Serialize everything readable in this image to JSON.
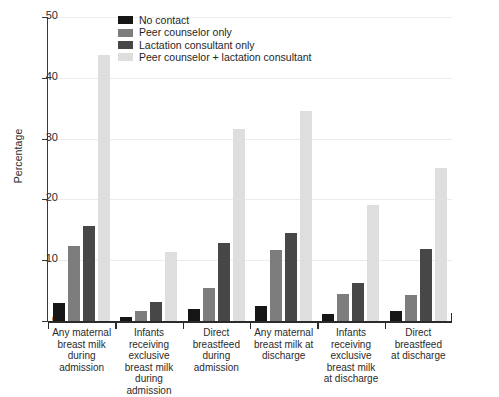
{
  "chart_data": {
    "type": "bar",
    "title": "",
    "xlabel": "",
    "ylabel": "Percentage",
    "ylim": [
      0,
      50
    ],
    "yticks": [
      0,
      10,
      20,
      30,
      40,
      50
    ],
    "grid": true,
    "legend_position": "top-center",
    "categories": [
      "Any maternal breast milk during admission",
      "Infants receiving exclusive breast milk during admission",
      "Direct breastfeed during admission",
      "Any maternal breast milk at discharge",
      "Infants receiving exclusive breast milk at discharge",
      "Direct breastfeed at discharge"
    ],
    "category_lines": [
      [
        "Any maternal",
        "breast milk",
        "during",
        "admission"
      ],
      [
        "Infants",
        "receiving",
        "exclusive",
        "breast milk",
        "during",
        "admission"
      ],
      [
        "Direct",
        "breastfeed",
        "during",
        "admission"
      ],
      [
        "Any maternal",
        "breast milk at",
        "discharge"
      ],
      [
        "Infants",
        "receiving",
        "exclusive",
        "breast milk",
        "at discharge"
      ],
      [
        "Direct",
        "breastfeed",
        "at discharge"
      ]
    ],
    "series": [
      {
        "name": "No contact",
        "color": "#161616",
        "values": [
          2.9,
          0.7,
          1.9,
          2.5,
          1.1,
          1.6
        ]
      },
      {
        "name": "Peer counselor only",
        "color": "#7d7d7d",
        "values": [
          12.4,
          1.6,
          5.5,
          11.6,
          4.4,
          4.3
        ]
      },
      {
        "name": "Lactation consultant only",
        "color": "#474747",
        "values": [
          15.6,
          3.2,
          12.9,
          14.4,
          6.3,
          11.8
        ]
      },
      {
        "name": "Peer counselor + lactation consultant",
        "color": "#dedede",
        "values": [
          43.8,
          11.3,
          31.5,
          34.6,
          19.0,
          25.1
        ]
      }
    ]
  },
  "axis": {
    "y_title": "Percentage"
  }
}
